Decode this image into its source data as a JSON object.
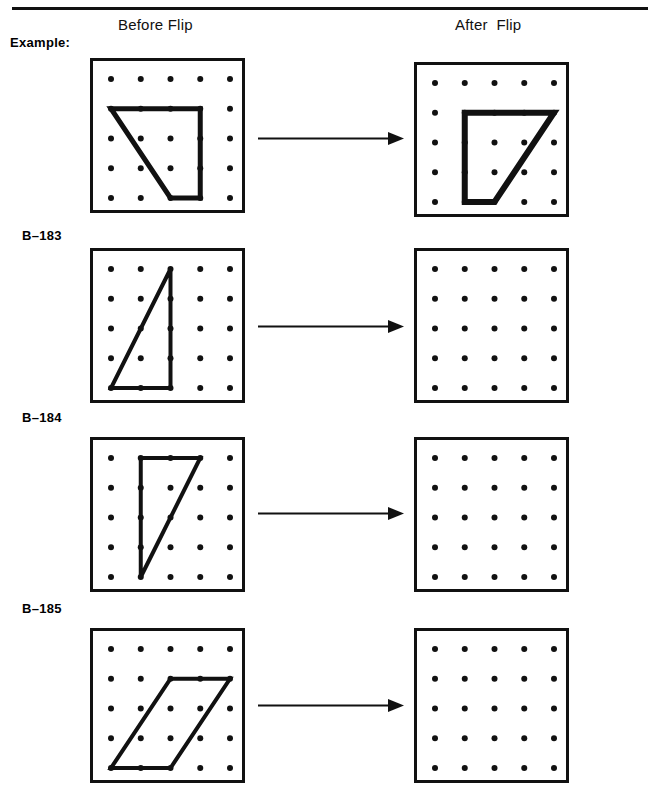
{
  "page": {
    "width": 658,
    "height": 794,
    "background": "#ffffff",
    "ink": "#111111"
  },
  "header": {
    "before_label": "Before Flip",
    "after_label": "After  Flip",
    "rule": {
      "x": 12,
      "y": 7,
      "width": 636,
      "height": 3
    }
  },
  "board_spec": {
    "size": 155,
    "border": 3,
    "grid_cols": 5,
    "grid_rows": 5,
    "dot_inset": 18,
    "dot_spacing": 29.75,
    "dot_radius": 3.0,
    "dot_color": "#111111"
  },
  "arrow": {
    "length": 146,
    "shaft_thickness": 2,
    "head_length": 16,
    "head_width": 13,
    "color": "#111111"
  },
  "rows": [
    {
      "id": "example",
      "label": "Example:",
      "label_x": 10,
      "label_y": 35,
      "left_board": {
        "x": 90,
        "y": 58,
        "shape": {
          "name": "trapezoid",
          "stroke": 5,
          "closed": true,
          "points": [
            [
              0,
              1
            ],
            [
              3,
              1
            ],
            [
              3,
              4
            ],
            [
              2,
              4
            ]
          ]
        }
      },
      "right_board": {
        "x": 414,
        "y": 62,
        "shape": {
          "name": "trapezoid-flipped",
          "stroke": 6,
          "closed": true,
          "points": [
            [
              1,
              1
            ],
            [
              4,
              1
            ],
            [
              2,
              4
            ],
            [
              1,
              4
            ]
          ]
        }
      },
      "arrow_x": 258,
      "arrow_y": 138
    },
    {
      "id": "b-183",
      "label": "B–183",
      "label_x": 22,
      "label_y": 228,
      "left_board": {
        "x": 90,
        "y": 248,
        "shape": {
          "name": "right-triangle",
          "stroke": 4,
          "closed": true,
          "points": [
            [
              2,
              0
            ],
            [
              0,
              4
            ],
            [
              2,
              4
            ]
          ]
        }
      },
      "right_board": {
        "x": 414,
        "y": 248,
        "shape": null
      },
      "arrow_x": 258,
      "arrow_y": 326
    },
    {
      "id": "b-184",
      "label": "B–184",
      "label_x": 22,
      "label_y": 410,
      "left_board": {
        "x": 90,
        "y": 437,
        "shape": {
          "name": "right-triangle",
          "stroke": 4,
          "closed": true,
          "points": [
            [
              1,
              0
            ],
            [
              3,
              0
            ],
            [
              1,
              4
            ]
          ]
        }
      },
      "right_board": {
        "x": 414,
        "y": 437,
        "shape": null
      },
      "arrow_x": 258,
      "arrow_y": 513
    },
    {
      "id": "b-185",
      "label": "B–185",
      "label_x": 22,
      "label_y": 601,
      "left_board": {
        "x": 90,
        "y": 628,
        "shape": {
          "name": "parallelogram",
          "stroke": 4,
          "closed": true,
          "points": [
            [
              2,
              1
            ],
            [
              4,
              1
            ],
            [
              2,
              4
            ],
            [
              0,
              4
            ]
          ]
        }
      },
      "right_board": {
        "x": 414,
        "y": 628,
        "shape": null
      },
      "arrow_x": 258,
      "arrow_y": 705
    }
  ]
}
